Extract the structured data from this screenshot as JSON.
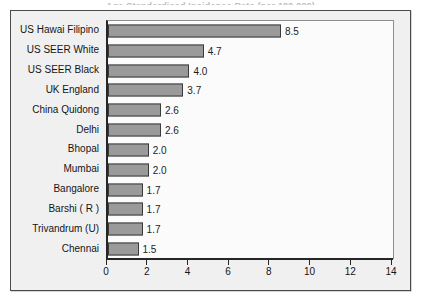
{
  "title_sliver": "Age Standardised Incidence Rate (per 100,000)",
  "chart_data": {
    "type": "bar",
    "orientation": "horizontal",
    "title": "",
    "xlabel": "",
    "ylabel": "",
    "xlim": [
      0,
      14
    ],
    "xticks": [
      0,
      2,
      4,
      6,
      8,
      10,
      12,
      14
    ],
    "grid": false,
    "legend": false,
    "bar_fill_color": "#9a9a9a",
    "bar_border_color": "#3a3a3a",
    "plot_background": "#fbfbfb",
    "chart_background": "#f0f0f0",
    "categories": [
      "US Hawai Filipino",
      "US SEER White",
      "US SEER Black",
      "UK England",
      "China Quidong",
      "Delhi",
      "Bhopal",
      "Mumbai",
      "Bangalore",
      "Barshi ( R )",
      "Trivandrum (U)",
      "Chennai"
    ],
    "values": [
      8.5,
      4.7,
      4.0,
      3.7,
      2.6,
      2.6,
      2.0,
      2.0,
      1.7,
      1.7,
      1.7,
      1.5
    ],
    "value_labels": [
      "8.5",
      "4.7",
      "4.0",
      "3.7",
      "2.6",
      "2.6",
      "2.0",
      "2.0",
      "1.7",
      "1.7",
      "1.7",
      "1.5"
    ]
  }
}
